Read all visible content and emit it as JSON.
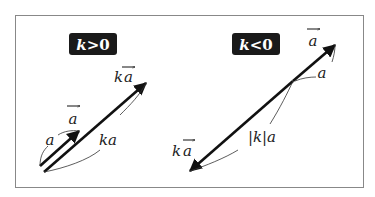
{
  "diagram": {
    "colors": {
      "ink": "#111111",
      "frame": "#888888",
      "badge_bg": "#1a1a1a",
      "badge_fg": "#ffffff"
    },
    "left_panel": {
      "badge": "k>0",
      "badge_k": "k",
      "badge_rel": ">0",
      "vector_a_label": "a",
      "vector_ka_label_k": "k",
      "vector_ka_label_a": "a",
      "length_a_label": "a",
      "length_ka_label": "ka"
    },
    "right_panel": {
      "badge": "k<0",
      "badge_k": "k",
      "badge_rel": "<0",
      "vector_a_label": "a",
      "vector_ka_label_k": "k",
      "vector_ka_label_a": "a",
      "length_a_label": "a",
      "length_ka_label": "|k|a"
    }
  }
}
